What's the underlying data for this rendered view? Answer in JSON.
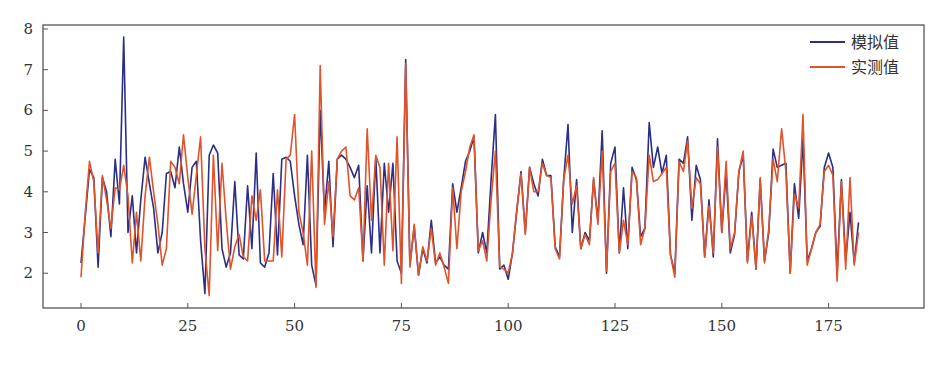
{
  "chart_data": {
    "type": "line",
    "title": "",
    "xlabel": "",
    "ylabel": "",
    "xlim": [
      -9,
      197
    ],
    "ylim": [
      1.2,
      8.1
    ],
    "grid": false,
    "legend_position": "upper right",
    "x_ticks": [
      0,
      25,
      50,
      75,
      100,
      125,
      150,
      175
    ],
    "y_ticks": [
      2,
      3,
      4,
      5,
      6,
      7,
      8
    ],
    "series": [
      {
        "name": "模拟值",
        "color": "#2b2f86",
        "values": [
          2.25,
          3.4,
          4.55,
          4.35,
          2.15,
          4.35,
          4.0,
          2.9,
          4.8,
          3.7,
          7.8,
          3.0,
          3.9,
          2.5,
          3.8,
          4.85,
          4.2,
          3.6,
          2.5,
          3.0,
          4.45,
          4.5,
          4.1,
          5.1,
          4.2,
          3.5,
          4.6,
          4.75,
          2.8,
          1.5,
          4.9,
          5.15,
          4.95,
          2.6,
          2.15,
          2.5,
          4.25,
          2.45,
          2.35,
          4.15,
          2.6,
          4.95,
          2.25,
          2.15,
          2.5,
          4.45,
          2.45,
          4.8,
          4.85,
          4.75,
          3.9,
          3.2,
          2.7,
          4.9,
          2.2,
          1.7,
          6.0,
          3.5,
          4.75,
          2.65,
          4.8,
          4.9,
          4.8,
          4.6,
          4.35,
          4.65,
          2.3,
          4.15,
          2.5,
          4.85,
          2.5,
          4.7,
          3.5,
          4.7,
          2.3,
          2.0,
          7.25,
          2.2,
          3.15,
          1.95,
          2.6,
          2.25,
          3.3,
          2.25,
          2.4,
          2.2,
          2.1,
          4.2,
          3.5,
          4.1,
          4.75,
          5.0,
          5.35,
          2.5,
          3.0,
          2.5,
          4.3,
          5.9,
          2.1,
          2.2,
          1.85,
          2.5,
          3.5,
          4.5,
          3.0,
          4.6,
          4.2,
          3.9,
          4.8,
          4.4,
          4.4,
          2.65,
          2.4,
          4.3,
          5.65,
          3.0,
          4.3,
          2.6,
          3.0,
          2.8,
          4.3,
          3.3,
          5.5,
          2.0,
          4.7,
          5.1,
          2.5,
          4.1,
          2.6,
          4.6,
          4.3,
          2.9,
          3.1,
          5.7,
          4.6,
          5.1,
          4.45,
          4.9,
          2.45,
          2.0,
          4.8,
          4.7,
          5.35,
          3.3,
          4.65,
          4.3,
          2.4,
          3.8,
          2.4,
          5.3,
          3.0,
          4.5,
          2.5,
          2.95,
          4.5,
          4.9,
          2.3,
          3.5,
          2.1,
          4.3,
          2.3,
          3.0,
          5.05,
          4.6,
          4.65,
          4.7,
          2.0,
          4.2,
          3.35,
          5.3,
          2.3,
          2.6,
          3.0,
          3.15,
          4.6,
          4.95,
          4.6,
          2.0,
          4.3,
          2.3,
          3.5,
          2.25,
          3.25
        ]
      },
      {
        "name": "实测值",
        "color": "#e0542a",
        "values": [
          1.9,
          3.5,
          4.75,
          4.25,
          2.5,
          4.4,
          3.8,
          3.1,
          4.1,
          4.05,
          4.65,
          3.9,
          2.25,
          3.5,
          2.3,
          3.9,
          4.85,
          4.0,
          3.2,
          2.2,
          2.6,
          4.75,
          4.6,
          4.2,
          5.4,
          4.35,
          3.45,
          4.4,
          5.35,
          2.6,
          1.45,
          4.9,
          2.55,
          4.7,
          3.3,
          2.1,
          2.65,
          2.95,
          2.4,
          2.3,
          3.9,
          3.3,
          4.05,
          2.3,
          2.3,
          2.3,
          4.05,
          2.4,
          4.8,
          4.9,
          5.9,
          3.5,
          3.0,
          2.2,
          5.0,
          1.65,
          7.1,
          3.2,
          4.25,
          2.9,
          4.8,
          5.0,
          5.1,
          3.9,
          3.8,
          4.1,
          2.3,
          5.55,
          3.3,
          4.9,
          4.6,
          2.2,
          4.7,
          2.55,
          5.35,
          1.75,
          7.15,
          2.15,
          3.2,
          1.95,
          2.65,
          2.3,
          3.1,
          2.2,
          2.5,
          2.15,
          1.75,
          4.1,
          2.6,
          4.0,
          4.5,
          5.1,
          5.4,
          2.55,
          2.8,
          2.3,
          3.8,
          5.0,
          2.15,
          2.1,
          2.0,
          2.5,
          3.55,
          4.45,
          2.95,
          4.6,
          4.0,
          4.0,
          4.7,
          4.4,
          4.35,
          2.6,
          2.35,
          4.3,
          4.9,
          3.7,
          4.15,
          2.6,
          2.95,
          2.7,
          4.35,
          3.2,
          5.0,
          2.05,
          4.5,
          4.7,
          2.5,
          3.3,
          2.7,
          4.5,
          4.35,
          2.7,
          3.1,
          4.9,
          4.25,
          4.3,
          4.45,
          4.6,
          2.45,
          1.9,
          4.75,
          4.5,
          5.25,
          3.6,
          4.35,
          4.2,
          2.4,
          3.65,
          2.5,
          5.1,
          3.0,
          4.75,
          2.6,
          3.0,
          4.5,
          5.0,
          2.25,
          3.4,
          2.1,
          4.35,
          2.25,
          3.1,
          4.8,
          4.25,
          5.55,
          4.5,
          2.0,
          3.95,
          3.6,
          5.9,
          2.2,
          2.6,
          3.0,
          3.2,
          4.5,
          4.65,
          4.4,
          1.8,
          4.25,
          2.1,
          4.35,
          2.2,
          3.0
        ]
      }
    ]
  },
  "legend": {
    "items": [
      {
        "label": "模拟值",
        "color": "#2b2f86"
      },
      {
        "label": "实测值",
        "color": "#e0542a"
      }
    ]
  },
  "axes": {
    "x_tick_labels": [
      "0",
      "25",
      "50",
      "75",
      "100",
      "125",
      "150",
      "175"
    ],
    "y_tick_labels": [
      "2",
      "3",
      "4",
      "5",
      "6",
      "7",
      "8"
    ]
  }
}
